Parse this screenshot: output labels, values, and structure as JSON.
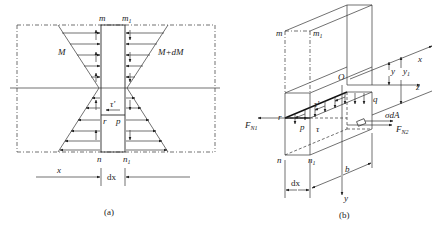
{
  "figure_a": {
    "caption": "(a)",
    "labels": {
      "m": "m",
      "m1": "m",
      "m1_sub": "1",
      "M": "M",
      "M_dM": "M+dM",
      "tau_prime": "τ'",
      "r": "r",
      "p": "p",
      "n": "n",
      "n1": "n",
      "n1_sub": "1",
      "x": "x",
      "dx": "dx"
    }
  },
  "figure_b": {
    "caption": "(b)",
    "labels": {
      "m": "m",
      "m1": "m",
      "m1_sub": "1",
      "O": "O",
      "x": "x",
      "y_axis": "y",
      "z": "z",
      "y": "y",
      "y1": "y",
      "y1_sub": "1",
      "q": "q",
      "tau_prime": "τ'",
      "tau": "τ",
      "r": "r",
      "p": "p",
      "F_N1": "F",
      "F_N1_sub": "N1",
      "F_N2": "F",
      "F_N2_sub": "N2",
      "sigma_dA": "σdA",
      "n": "n",
      "n1": "n",
      "n1_sub": "1",
      "dx": "dx",
      "b": "b"
    }
  }
}
